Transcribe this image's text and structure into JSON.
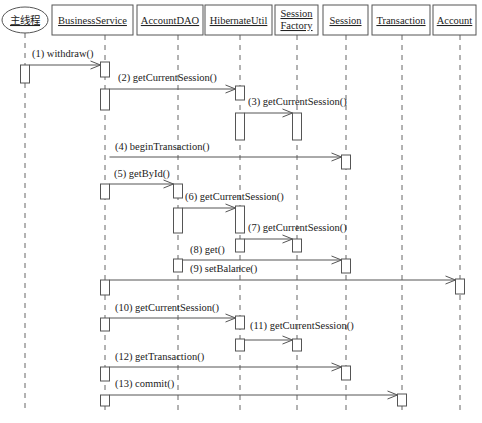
{
  "diagram": {
    "type": "uml-sequence",
    "participants": [
      {
        "id": "main",
        "label": [
          "主线程"
        ],
        "x": 25,
        "box": [
          2,
          7,
          46,
          26
        ],
        "shape": "ellipse",
        "cn": true
      },
      {
        "id": "bs",
        "label": [
          "BusinessService"
        ],
        "x": 105,
        "box": [
          52,
          5,
          81,
          30
        ],
        "shape": "rect"
      },
      {
        "id": "dao",
        "label": [
          "AccountDAO"
        ],
        "x": 178,
        "box": [
          137,
          5,
          66,
          30
        ],
        "shape": "rect"
      },
      {
        "id": "hu",
        "label": [
          "HibernateUtil"
        ],
        "x": 240,
        "box": [
          205,
          5,
          67,
          30
        ],
        "shape": "rect"
      },
      {
        "id": "sf",
        "label": [
          "Session",
          "Factory"
        ],
        "x": 297,
        "box": [
          275,
          5,
          43,
          30
        ],
        "shape": "rect"
      },
      {
        "id": "sess",
        "label": [
          "Session"
        ],
        "x": 346,
        "box": [
          323,
          5,
          45,
          30
        ],
        "shape": "rect"
      },
      {
        "id": "tx",
        "label": [
          "Transaction"
        ],
        "x": 402,
        "box": [
          372,
          5,
          58,
          30
        ],
        "shape": "rect"
      },
      {
        "id": "acc",
        "label": [
          "Account"
        ],
        "x": 460,
        "box": [
          433,
          5,
          43,
          30
        ],
        "shape": "rect"
      }
    ],
    "lifeline_end_y": 412,
    "messages": [
      {
        "n": 1,
        "label": "(1) withdraw()",
        "from": "main",
        "to": "bs",
        "y": 65,
        "lx": 32,
        "ly": 57
      },
      {
        "n": 2,
        "label": "(2) getCurrentSession()",
        "from": "bs",
        "to": "hu",
        "y": 89,
        "lx": 118,
        "ly": 81
      },
      {
        "n": 3,
        "label": "(3) getCurrentSession()",
        "from": "hu",
        "to": "sf",
        "y": 113,
        "lx": 248,
        "ly": 105
      },
      {
        "n": 4,
        "label": "(4) beginTransaction()",
        "from": "bs",
        "to": "sess",
        "y": 157,
        "lx": 115,
        "ly": 150
      },
      {
        "n": 5,
        "label": "(5) getById()",
        "from": "bs",
        "to": "dao",
        "y": 184,
        "lx": 114,
        "ly": 177
      },
      {
        "n": 6,
        "label": "(6) getCurrentSession()",
        "from": "dao",
        "to": "hu",
        "y": 208,
        "lx": 185,
        "ly": 200
      },
      {
        "n": 7,
        "label": "(7) getCurrentSession()",
        "from": "hu",
        "to": "sf",
        "y": 239,
        "lx": 248,
        "ly": 231
      },
      {
        "n": 8,
        "label": "(8) get()",
        "from": "dao",
        "to": "sess",
        "y": 260,
        "lx": 190,
        "ly": 253
      },
      {
        "n": 9,
        "label": "(9) setBalance()",
        "from": "bs",
        "to": "acc",
        "y": 280,
        "lx": 190,
        "ly": 272
      },
      {
        "n": 10,
        "label": "(10) getCurrentSession()",
        "from": "bs",
        "to": "hu",
        "y": 318,
        "lx": 115,
        "ly": 311
      },
      {
        "n": 11,
        "label": "(11) getCurrentSession()",
        "from": "hu",
        "to": "sf",
        "y": 340,
        "lx": 250,
        "ly": 329
      },
      {
        "n": 12,
        "label": "(12) getTransaction()",
        "from": "bs",
        "to": "sess",
        "y": 367,
        "lx": 115,
        "ly": 360
      },
      {
        "n": 13,
        "label": "(13) commit()",
        "from": "bs",
        "to": "tx",
        "y": 395,
        "lx": 115,
        "ly": 387
      }
    ],
    "activations": [
      {
        "on": "main",
        "y": 65,
        "h": 18
      },
      {
        "on": "bs",
        "y": 62,
        "h": 15
      },
      {
        "on": "bs",
        "y": 89,
        "h": 21
      },
      {
        "on": "hu",
        "y": 86,
        "h": 14
      },
      {
        "on": "hu",
        "y": 113,
        "h": 27
      },
      {
        "on": "sf",
        "y": 113,
        "h": 27
      },
      {
        "on": "sess",
        "y": 155,
        "h": 14
      },
      {
        "on": "bs",
        "y": 184,
        "h": 15
      },
      {
        "on": "dao",
        "y": 184,
        "h": 14
      },
      {
        "on": "dao",
        "y": 208,
        "h": 25
      },
      {
        "on": "hu",
        "y": 206,
        "h": 27
      },
      {
        "on": "hu",
        "y": 239,
        "h": 13
      },
      {
        "on": "sf",
        "y": 239,
        "h": 13
      },
      {
        "on": "sess",
        "y": 259,
        "h": 14
      },
      {
        "on": "dao",
        "y": 259,
        "h": 13
      },
      {
        "on": "bs",
        "y": 280,
        "h": 15
      },
      {
        "on": "acc",
        "y": 279,
        "h": 15
      },
      {
        "on": "bs",
        "y": 318,
        "h": 13
      },
      {
        "on": "hu",
        "y": 316,
        "h": 13
      },
      {
        "on": "hu",
        "y": 339,
        "h": 12
      },
      {
        "on": "sf",
        "y": 339,
        "h": 12
      },
      {
        "on": "bs",
        "y": 367,
        "h": 14
      },
      {
        "on": "sess",
        "y": 366,
        "h": 14
      },
      {
        "on": "bs",
        "y": 395,
        "h": 11
      },
      {
        "on": "tx",
        "y": 394,
        "h": 12
      }
    ],
    "act_width": 9
  }
}
